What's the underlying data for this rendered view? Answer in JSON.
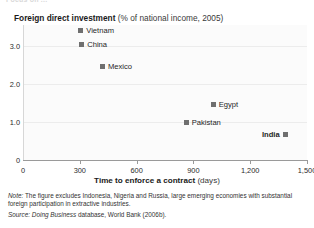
{
  "top_clip_text": "Focus on ...",
  "title": {
    "main": "Foreign direct investment",
    "sub": "(% of national income, 2005)"
  },
  "axis": {
    "x_title_main": "Time to enforce a contract",
    "x_title_unit": "(days)",
    "x_ticks": [
      "0",
      "300",
      "600",
      "900",
      "1,200",
      "1,500"
    ],
    "y_ticks": [
      "0",
      "1.0",
      "2.0",
      "3.0"
    ]
  },
  "notes": {
    "note_label": "Note:",
    "note_text": " The figure excludes Indonesia, Nigeria and Russia, large emerging economies with substantial foreign participation in extractive industries.",
    "source_label": "Source:",
    "source_text_italic": " Doing Business",
    "source_text_rest": " database, World Bank (2006b)."
  },
  "colors": {
    "marker": "#6f6f6f",
    "plot_bg": "#fbfbfb",
    "axis": "#9a9a9a",
    "grid": "#ececec"
  },
  "chart_data": {
    "type": "scatter",
    "title": "Foreign direct investment (% of national income, 2005)",
    "xlabel": "Time to enforce a contract (days)",
    "ylabel": "Foreign direct investment (% of national income, 2005)",
    "xlim": [
      0,
      1500
    ],
    "ylim": [
      0,
      3.6
    ],
    "xticks": [
      0,
      300,
      600,
      900,
      1200,
      1500
    ],
    "yticks": [
      0,
      1.0,
      2.0,
      3.0
    ],
    "grid": true,
    "legend": "none",
    "points": [
      {
        "label": "Vietnam",
        "x": 305,
        "y": 3.42,
        "label_side": "right",
        "bold": false
      },
      {
        "label": "China",
        "x": 310,
        "y": 3.05,
        "label_side": "right",
        "bold": false
      },
      {
        "label": "Mexico",
        "x": 420,
        "y": 2.45,
        "label_side": "right",
        "bold": false
      },
      {
        "label": "Egypt",
        "x": 1005,
        "y": 1.45,
        "label_side": "right",
        "bold": false
      },
      {
        "label": "Pakistan",
        "x": 862,
        "y": 1.0,
        "label_side": "right",
        "bold": false
      },
      {
        "label": "India",
        "x": 1385,
        "y": 0.66,
        "label_side": "left",
        "bold": true
      }
    ]
  }
}
